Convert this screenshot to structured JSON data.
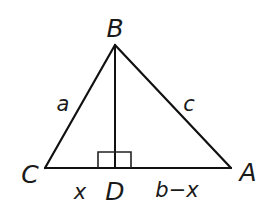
{
  "diagram": {
    "type": "right-triangle-altitude",
    "stroke_color": "#111111",
    "vertices": {
      "B": {
        "label": "B",
        "x": 115,
        "y": 45
      },
      "C": {
        "label": "C",
        "x": 45,
        "y": 168
      },
      "A": {
        "label": "A",
        "x": 231,
        "y": 168
      },
      "D": {
        "label": "D",
        "x": 115,
        "y": 168
      }
    },
    "vertex_labels": {
      "B": "B",
      "C": "C",
      "A": "A",
      "D": "D"
    },
    "side_labels": {
      "BC": "a",
      "BA": "c",
      "CD": "x",
      "DA": "b−x"
    },
    "right_angle_marker": {
      "at": "D",
      "size": 16
    }
  }
}
